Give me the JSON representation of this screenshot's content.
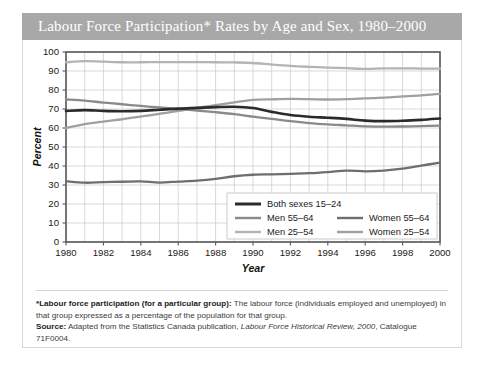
{
  "title": "Labour Force Participation* Rates by Age and Sex, 1980–2000",
  "colors": {
    "banner": "#a8a8a8",
    "banner_text": "#ffffff",
    "grid": "#c8c8c8",
    "axis": "#595959",
    "both_sexes_15_24": "#2b2b2b",
    "men_55_64": "#8a8a8a",
    "men_25_54": "#b4b4b4",
    "women_55_64": "#6e6e6e",
    "women_25_54": "#a0a0a0"
  },
  "footnote": {
    "def_label": "*Labour force participation (for a particular group):",
    "def_text": " The labour force (individuals employed and unemployed) in that group expressed as a percentage of the population for that group.",
    "source_label": "Source:",
    "source_text_a": " Adapted from the Statistics Canada publication, ",
    "source_italic": "Labour Force Historical Review, 2000",
    "source_text_b": ", Catalogue 71F0004."
  },
  "chart_data": {
    "type": "line",
    "title": "Labour Force Participation* Rates by Age and Sex, 1980–2000",
    "xlabel": "Year",
    "ylabel": "Percent",
    "xlim": [
      1980,
      2000
    ],
    "ylim": [
      0,
      100
    ],
    "ytick_step": 10,
    "xtick_step": 2,
    "grid": true,
    "legend_position": "inside-bottom-right",
    "yticks": [
      0,
      10,
      20,
      30,
      40,
      50,
      60,
      70,
      80,
      90,
      100
    ],
    "xticks": [
      1980,
      1982,
      1984,
      1986,
      1988,
      1990,
      1992,
      1994,
      1996,
      1998,
      2000
    ],
    "x": [
      1980,
      1981,
      1982,
      1983,
      1984,
      1985,
      1986,
      1987,
      1988,
      1989,
      1990,
      1991,
      1992,
      1993,
      1994,
      1995,
      1996,
      1997,
      1998,
      1999,
      2000
    ],
    "series": [
      {
        "name": "Both sexes 15–24",
        "key": "both_sexes_15_24",
        "color": "#2b2b2b",
        "width": 2.6,
        "values": [
          69.0,
          69.4,
          69.0,
          68.8,
          69.0,
          69.6,
          70.2,
          70.6,
          71.0,
          71.2,
          70.5,
          68.5,
          66.8,
          65.9,
          65.4,
          64.8,
          63.9,
          63.6,
          63.8,
          64.3,
          65.0
        ]
      },
      {
        "name": "Men 55–64",
        "key": "men_55_64",
        "color": "#8a8a8a",
        "width": 2.3,
        "values": [
          75.0,
          74.4,
          73.4,
          72.5,
          71.6,
          70.8,
          70.0,
          69.2,
          68.3,
          67.3,
          66.0,
          64.8,
          63.6,
          62.6,
          61.9,
          61.4,
          60.9,
          60.7,
          60.8,
          61.0,
          61.3
        ]
      },
      {
        "name": "Men 25–54",
        "key": "men_25_54",
        "color": "#b4b4b4",
        "width": 2.3,
        "values": [
          94.6,
          95.2,
          94.9,
          94.6,
          94.6,
          94.7,
          94.7,
          94.7,
          94.6,
          94.5,
          94.2,
          93.4,
          92.7,
          92.2,
          91.8,
          91.5,
          91.1,
          91.4,
          91.4,
          91.3,
          91.2
        ]
      },
      {
        "name": "Women 55–64",
        "key": "women_55_64",
        "color": "#6e6e6e",
        "width": 2.3,
        "values": [
          32.0,
          31.2,
          31.5,
          31.7,
          31.9,
          31.3,
          31.8,
          32.3,
          33.2,
          34.6,
          35.4,
          35.6,
          35.9,
          36.2,
          36.8,
          37.6,
          37.2,
          37.6,
          38.6,
          40.2,
          41.8
        ]
      },
      {
        "name": "Women 25–54",
        "key": "women_25_54",
        "color": "#a0a0a0",
        "width": 2.3,
        "values": [
          60.0,
          62.0,
          63.4,
          64.6,
          66.0,
          67.4,
          69.0,
          70.6,
          72.0,
          73.5,
          74.8,
          75.1,
          75.3,
          75.2,
          75.0,
          75.2,
          75.6,
          76.0,
          76.6,
          77.2,
          78.0
        ]
      }
    ],
    "legend": [
      {
        "label": "Both sexes 15–24",
        "color": "#2b2b2b",
        "col": 0,
        "row": 0
      },
      {
        "label": "Men 55–64",
        "color": "#8a8a8a",
        "col": 0,
        "row": 1
      },
      {
        "label": "Men 25–54",
        "color": "#b4b4b4",
        "col": 0,
        "row": 2
      },
      {
        "label": "Women 55–64",
        "color": "#6e6e6e",
        "col": 1,
        "row": 1
      },
      {
        "label": "Women 25–54",
        "color": "#a0a0a0",
        "col": 1,
        "row": 2
      }
    ]
  }
}
